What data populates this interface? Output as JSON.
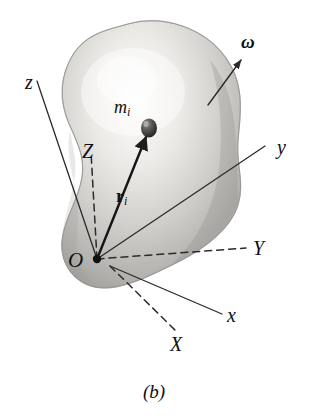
{
  "figure": {
    "caption": "(b)",
    "body_fill_light": "#f2f1ef",
    "body_fill_mid": "#c9c7c4",
    "body_fill_dark": "#a6a4a1",
    "line_color": "#2b2b2b",
    "background": "#ffffff"
  },
  "labels": {
    "omega": "ω",
    "mass": {
      "symbol": "m",
      "subscript": "i"
    },
    "position_vector": {
      "symbol": "r",
      "subscript": "i"
    },
    "origin": "O",
    "axis_x_lower": "x",
    "axis_y_lower": "y",
    "axis_z_lower": "z",
    "axis_X_upper": "X",
    "axis_Y_upper": "Y",
    "axis_Z_upper": "Z"
  },
  "geometry": {
    "origin_point": {
      "x": 97,
      "y": 259
    },
    "secondary_origin_point": {
      "x": 110,
      "y": 266
    },
    "mass_point": {
      "x": 149,
      "y": 128
    },
    "omega_arrow": {
      "x1": 208,
      "y1": 105,
      "x2": 243,
      "y2": 57
    },
    "axes": [
      {
        "name": "z",
        "style": "solid",
        "x1": 97,
        "y1": 259,
        "x2": 37,
        "y2": 81
      },
      {
        "name": "y",
        "style": "solid",
        "x1": 97,
        "y1": 259,
        "x2": 265,
        "y2": 146
      },
      {
        "name": "x",
        "style": "solid",
        "x1": 110,
        "y1": 266,
        "x2": 222,
        "y2": 314
      },
      {
        "name": "Z",
        "style": "dashed",
        "x1": 97,
        "y1": 259,
        "x2": 91,
        "y2": 152
      },
      {
        "name": "Y",
        "style": "dashed",
        "x1": 97,
        "y1": 259,
        "x2": 246,
        "y2": 248
      },
      {
        "name": "X",
        "style": "dashed",
        "x1": 110,
        "y1": 266,
        "x2": 176,
        "y2": 331
      }
    ]
  }
}
